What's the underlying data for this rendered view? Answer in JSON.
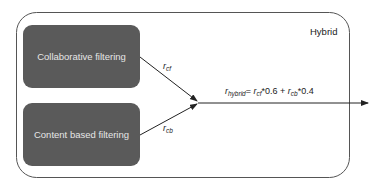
{
  "diagram": {
    "container": {
      "label": "Hybrid"
    },
    "boxes": [
      {
        "id": "cf",
        "label": "Collaborative filtering"
      },
      {
        "id": "cb",
        "label": "Content based filtering"
      }
    ],
    "edges": [
      {
        "from": "cf",
        "label_main": "r",
        "label_sub": "cf"
      },
      {
        "from": "cb",
        "label_main": "r",
        "label_sub": "cb"
      }
    ],
    "formula": {
      "lhs_main": "r",
      "lhs_sub": "hybrid",
      "eq": "= ",
      "t1_main": "r",
      "t1_sub": "cf",
      "t1_coef": "*0.6 + ",
      "t2_main": "r",
      "t2_sub": "cb",
      "t2_coef": "*0.4"
    },
    "colors": {
      "box_fill": "#5a5a5a",
      "box_text": "#e6e6e6",
      "stroke": "#333333"
    }
  }
}
